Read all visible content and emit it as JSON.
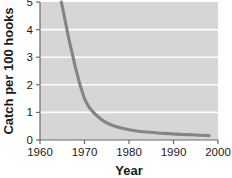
{
  "chart_data": {
    "type": "line",
    "title": "",
    "xlabel": "Year",
    "ylabel": "Catch per 100 hooks",
    "xlim": [
      1960,
      2000
    ],
    "ylim": [
      0,
      5
    ],
    "grid": true,
    "legend": null,
    "x_ticks": [
      1960,
      1970,
      1980,
      1990,
      2000
    ],
    "x_tick_labels": [
      "1960",
      "1970",
      "1980",
      "1990",
      "2000"
    ],
    "y_ticks": [
      0,
      1,
      2,
      3,
      4,
      5
    ],
    "y_tick_labels": [
      "0",
      "1",
      "2",
      "3",
      "4",
      "5"
    ],
    "series": [
      {
        "name": "Catch rate",
        "color": "#848484",
        "x": [
          1964.8,
          1965.5,
          1966,
          1966.5,
          1967,
          1967.5,
          1968,
          1968.5,
          1969,
          1969.5,
          1970,
          1971,
          1972,
          1973,
          1974,
          1975,
          1976,
          1977,
          1978,
          1980,
          1982,
          1984,
          1986,
          1988,
          1990,
          1992,
          1994,
          1996,
          1998
        ],
        "y": [
          5.0,
          4.45,
          4.05,
          3.65,
          3.3,
          2.95,
          2.6,
          2.3,
          2.0,
          1.75,
          1.5,
          1.2,
          1.0,
          0.85,
          0.72,
          0.62,
          0.55,
          0.49,
          0.44,
          0.37,
          0.32,
          0.29,
          0.26,
          0.24,
          0.22,
          0.2,
          0.19,
          0.17,
          0.16
        ]
      }
    ]
  },
  "axis_titles": {
    "x": "Year",
    "y": "Catch per 100 hooks"
  }
}
